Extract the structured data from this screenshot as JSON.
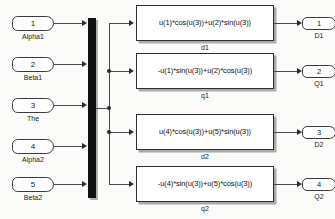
{
  "diagram": {
    "background_color": "#fbfbf9",
    "line_color": "#4a4a4a",
    "block_border_color": "#2e2e2e",
    "mux_color": "#111111"
  },
  "input_ports": [
    {
      "number": "1",
      "label": "Alpha1"
    },
    {
      "number": "2",
      "label": "Beta1"
    },
    {
      "number": "3",
      "label": "The"
    },
    {
      "number": "4",
      "label": "Alpha2"
    },
    {
      "number": "5",
      "label": "Beta2"
    }
  ],
  "mux": {
    "name": "Mux",
    "inputs": 5
  },
  "fcn_blocks": [
    {
      "expression": "u(1)*cos(u(3))+u(2)*sin(u(3))",
      "label": "d1"
    },
    {
      "expression": "-u(1)*sin(u(3))+u(2)*cos(u(3))",
      "label": "q1"
    },
    {
      "expression": "u(4)*cos(u(3))+u(5)*sin(u(3))",
      "label": "d2"
    },
    {
      "expression": "-u(4)*sin(u(3))+u(5)*cos(u(3))",
      "label": "q2"
    }
  ],
  "output_ports": [
    {
      "number": "1",
      "label": "D1"
    },
    {
      "number": "2",
      "label": "Q1"
    },
    {
      "number": "3",
      "label": "D2"
    },
    {
      "number": "4",
      "label": "Q2"
    }
  ]
}
